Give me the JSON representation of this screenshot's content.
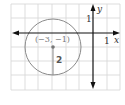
{
  "figure": {
    "type": "coordinate-plane-circle",
    "grid": {
      "x_min": -6,
      "x_max": 2,
      "y_min": -4,
      "y_max": 2,
      "unit": 1
    },
    "axes": {
      "x_label": "x",
      "y_label": "y",
      "x_tick_label": "1",
      "y_tick_label": "1"
    },
    "circle": {
      "center_label": "(−3, −1)",
      "center": [
        -3,
        -1
      ],
      "radius": 2,
      "radius_label": "2"
    },
    "colors": {
      "grid": "#d4d4d4",
      "axes": "#111111",
      "circle": "#8a8a8a",
      "center_point": "#777777"
    }
  }
}
